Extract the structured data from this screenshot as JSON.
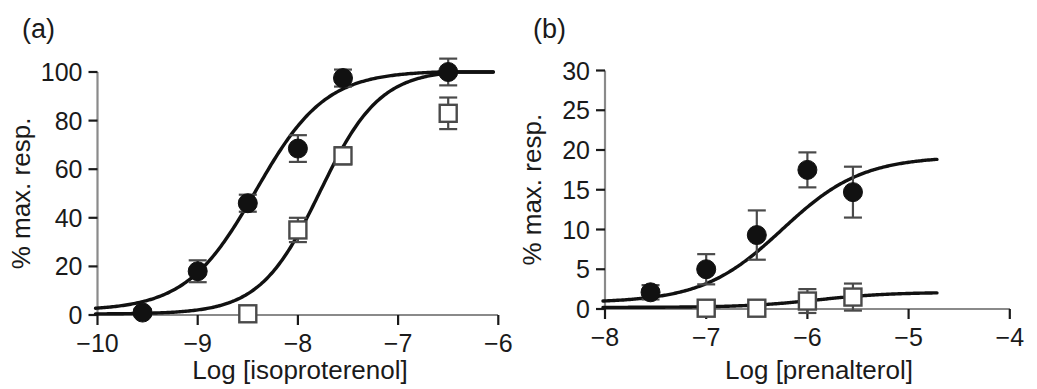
{
  "figure": {
    "background_color": "#ffffff",
    "ink_color": "#111111",
    "panels": [
      "a",
      "b"
    ]
  },
  "panel_a": {
    "label": "(a)",
    "xlabel": "Log [isoproterenol]",
    "ylabel": "% max. resp.",
    "xticks": [
      "−10",
      "−9",
      "−8",
      "−7",
      "−6"
    ],
    "yticks": [
      "0",
      "20",
      "40",
      "60",
      "80",
      "100"
    ]
  },
  "panel_b": {
    "label": "(b)",
    "xlabel": "Log [prenalterol]",
    "ylabel": "% max. resp.",
    "xticks": [
      "−8",
      "−7",
      "−6",
      "−5",
      "−4"
    ],
    "yticks": [
      "0",
      "5",
      "10",
      "15",
      "20",
      "25",
      "30"
    ]
  },
  "chart_data": [
    {
      "type": "scatter",
      "panel": "a",
      "title": "(a)",
      "xlabel": "Log [isoproterenol]",
      "ylabel": "% max. resp.",
      "xlim": [
        -10,
        -6
      ],
      "ylim": [
        0,
        100
      ],
      "xticks": [
        -10,
        -9,
        -8,
        -7,
        -6
      ],
      "yticks": [
        0,
        20,
        40,
        60,
        80,
        100
      ],
      "grid": false,
      "legend": "none",
      "series": [
        {
          "name": "filled-circles",
          "marker": "filled circle",
          "x": [
            -9.55,
            -9.0,
            -8.5,
            -8.0,
            -7.55,
            -6.5
          ],
          "y": [
            1.0,
            18.0,
            46.0,
            68.5,
            97.5,
            100.0
          ],
          "yerr": [
            1.5,
            4.5,
            3.5,
            5.5,
            3.5,
            5.5
          ],
          "fit": {
            "model": "logistic",
            "bottom": 1.8,
            "top": 100.5,
            "logEC50": -8.42,
            "hill": 1.25
          }
        },
        {
          "name": "open-squares",
          "marker": "open square",
          "x": [
            -8.5,
            -8.0,
            -7.55,
            -6.5
          ],
          "y": [
            0.5,
            35.0,
            65.5,
            83.0
          ],
          "yerr": [
            0.0,
            5.0,
            3.5,
            6.5
          ],
          "fit": {
            "model": "logistic",
            "bottom": 0.4,
            "top": 101.0,
            "logEC50": -7.78,
            "hill": 1.45
          }
        }
      ]
    },
    {
      "type": "scatter",
      "panel": "b",
      "title": "(b)",
      "xlabel": "Log [prenalterol]",
      "ylabel": "% max. resp.",
      "xlim": [
        -8,
        -4
      ],
      "ylim": [
        0,
        30
      ],
      "xticks": [
        -8,
        -7,
        -6,
        -5,
        -4
      ],
      "yticks": [
        0,
        5,
        10,
        15,
        20,
        25,
        30
      ],
      "grid": false,
      "legend": "none",
      "series": [
        {
          "name": "filled-circles",
          "marker": "filled circle",
          "x": [
            -7.55,
            -7.0,
            -6.5,
            -6.0,
            -5.55
          ],
          "y": [
            2.1,
            5.0,
            9.3,
            17.5,
            14.7
          ],
          "yerr": [
            0.9,
            1.9,
            3.1,
            2.2,
            3.2
          ],
          "fit": {
            "model": "logistic",
            "bottom": 0.8,
            "top": 19.2,
            "logEC50": -6.25,
            "hill": 1.1
          }
        },
        {
          "name": "open-squares",
          "marker": "open square",
          "x": [
            -7.0,
            -6.5,
            -6.0,
            -5.55
          ],
          "y": [
            0.1,
            0.1,
            1.0,
            1.5
          ],
          "yerr": [
            0.5,
            0.0,
            1.5,
            1.7
          ],
          "fit": {
            "model": "logistic",
            "bottom": 0.2,
            "top": 2.1,
            "logEC50": -5.9,
            "hill": 1.2
          }
        }
      ]
    }
  ]
}
